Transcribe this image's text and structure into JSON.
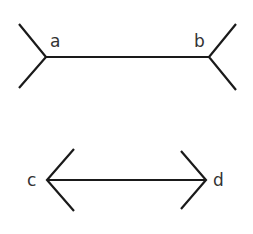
{
  "diagram": {
    "figures": [
      {
        "name": "fins-out",
        "shaft": {
          "x1": 46,
          "y1": 57,
          "x2": 209,
          "y2": 57
        },
        "left_fin": [
          [
            19,
            24
          ],
          [
            46,
            57
          ],
          [
            19,
            88
          ]
        ],
        "right_fin": [
          [
            236,
            24
          ],
          [
            209,
            57
          ],
          [
            236,
            90
          ]
        ],
        "labels": [
          {
            "text": "a",
            "x": 50,
            "y": 47
          },
          {
            "text": "b",
            "x": 194,
            "y": 47
          }
        ]
      },
      {
        "name": "fins-in",
        "shaft": {
          "x1": 47,
          "y1": 180,
          "x2": 206,
          "y2": 180
        },
        "left_fin": [
          [
            74,
            149
          ],
          [
            47,
            180
          ],
          [
            74,
            211
          ]
        ],
        "right_fin": [
          [
            181,
            151
          ],
          [
            206,
            180
          ],
          [
            181,
            209
          ]
        ],
        "labels": [
          {
            "text": "c",
            "x": 27,
            "y": 186
          },
          {
            "text": "d",
            "x": 213,
            "y": 186
          }
        ]
      }
    ],
    "colors": {
      "stroke": "#1a1a1a",
      "label": "#333333",
      "background": "#ffffff"
    }
  }
}
